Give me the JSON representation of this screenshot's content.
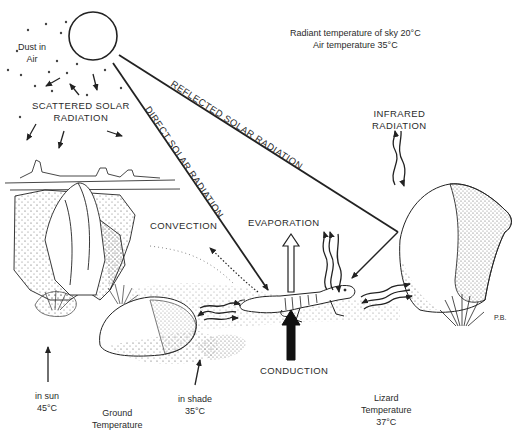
{
  "sky": {
    "radiant_temp_label": "Radiant temperature of sky 20°C",
    "air_temp_label": "Air temperature 35°C"
  },
  "labels": {
    "dust": [
      "Dust in",
      "Air"
    ],
    "scattered": [
      "SCATTERED SOLAR",
      "RADIATION"
    ],
    "direct": "DIRECT SOLAR RADIATION",
    "reflected": "REFLECTED SOLAR RADIATION",
    "infrared": [
      "INFRARED",
      "RADIATION"
    ],
    "convection": "CONVECTION",
    "evaporation": "EVAPORATION",
    "conduction": "CONDUCTION",
    "artist_initials": "P.B."
  },
  "ground": {
    "sun": [
      "in sun",
      "45°C"
    ],
    "shade": [
      "in shade",
      "35°C"
    ],
    "title": [
      "Ground",
      "Temperature"
    ]
  },
  "lizard": {
    "title": [
      "Lizard",
      "Temperature",
      "37°C"
    ]
  },
  "colors": {
    "line": "#222222",
    "stipple": "#555555",
    "background": "#ffffff"
  }
}
